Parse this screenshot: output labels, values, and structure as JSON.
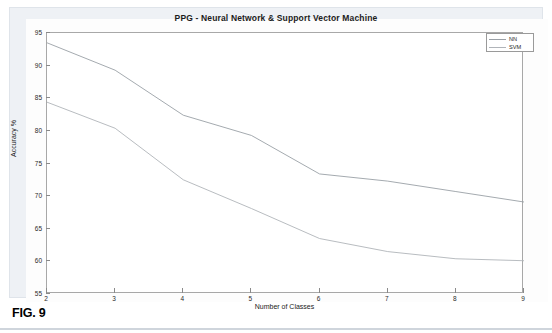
{
  "figure": {
    "caption": "FIG. 9"
  },
  "chart_data": {
    "type": "line",
    "title": "PPG - Neural Network & Support Vector Machine",
    "xlabel": "Number of Classes",
    "ylabel": "Accuracy %",
    "x": [
      2,
      3,
      4,
      5,
      6,
      7,
      8,
      9
    ],
    "xlim": [
      2,
      9
    ],
    "ylim": [
      55,
      95
    ],
    "xticks": [
      2,
      3,
      4,
      5,
      6,
      7,
      8,
      9
    ],
    "yticks": [
      55,
      60,
      65,
      70,
      75,
      80,
      85,
      90,
      95
    ],
    "grid": false,
    "legend_position": "top-right",
    "series": [
      {
        "name": "NN",
        "color": "#9aa0a6",
        "values": [
          93.5,
          89.3,
          82.4,
          79.3,
          73.4,
          72.3,
          70.7,
          69.1
        ]
      },
      {
        "name": "SVM",
        "color": "#b0b4b9",
        "values": [
          84.4,
          80.4,
          72.5,
          68.1,
          63.5,
          61.5,
          60.4,
          60.1
        ]
      }
    ]
  }
}
